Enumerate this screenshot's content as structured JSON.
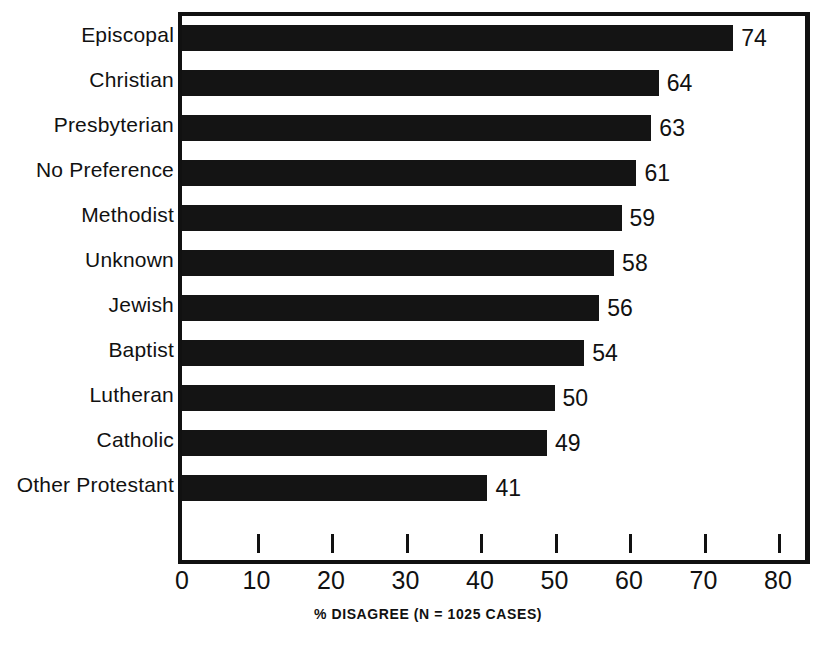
{
  "chart_data": {
    "type": "bar",
    "orientation": "horizontal",
    "title": "",
    "xlabel": "% DISAGREE (N = 1025 CASES)",
    "ylabel": "",
    "xlim": [
      0,
      80
    ],
    "xticks": [
      0,
      10,
      20,
      30,
      40,
      50,
      60,
      70,
      80
    ],
    "xtick_labels": [
      "0",
      "10",
      "20",
      "30",
      "40",
      "50",
      "60",
      "70",
      "80"
    ],
    "grid": false,
    "legend": null,
    "bar_color": "#141414",
    "frame_color": "#111111",
    "background": "#ffffff",
    "categories": [
      "Episcopal",
      "Christian",
      "Presbyterian",
      "No Preference",
      "Methodist",
      "Unknown",
      "Jewish",
      "Baptist",
      "Lutheran",
      "Catholic",
      "Other Protestant"
    ],
    "values": [
      74,
      64,
      63,
      61,
      59,
      58,
      56,
      54,
      50,
      49,
      41
    ],
    "value_labels": [
      "74",
      "64",
      "63",
      "61",
      "59",
      "58",
      "56",
      "54",
      "50",
      "49",
      "41"
    ]
  }
}
